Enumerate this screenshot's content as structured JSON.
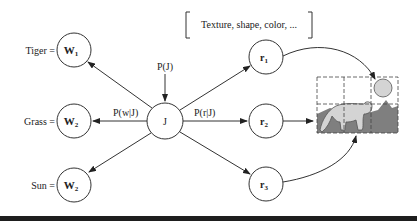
{
  "feature_box": {
    "text": "Texture, shape, color, ..."
  },
  "words": [
    {
      "label": "Tiger =",
      "node": "W",
      "sub": "1"
    },
    {
      "label": "Grass =",
      "node": "W",
      "sub": "2"
    },
    {
      "label": "Sun =",
      "node": "W",
      "sub": "2"
    }
  ],
  "center_node": {
    "label": "J"
  },
  "prior_label": "P(J)",
  "word_edge_label": "P(w|J)",
  "region_edge_label": "P(r|J)",
  "regions": [
    {
      "node": "r",
      "sub": "1"
    },
    {
      "node": "r",
      "sub": "2"
    },
    {
      "node": "r",
      "sub": "3"
    }
  ],
  "image": {
    "description": "segmented image with sun, tiger, grass"
  },
  "colors": {
    "stroke": "#333333",
    "fill_light": "#d4d4d4",
    "fill_dark": "#7f7f7f",
    "bar": "#1e1e1e"
  }
}
